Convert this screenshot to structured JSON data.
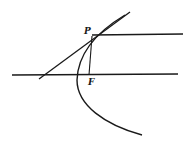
{
  "diagram": {
    "type": "parabola-tangent-construction",
    "labels": {
      "point_p": "P",
      "focus_f": "F"
    },
    "colors": {
      "stroke": "#1a1a1a",
      "background": "#ffffff"
    }
  }
}
